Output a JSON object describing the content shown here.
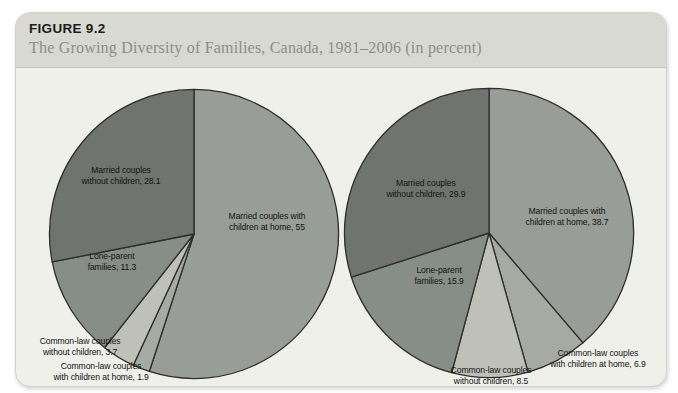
{
  "header": {
    "figure_label": "FIGURE 9.2",
    "title": "The Growing Diversity of Families, Canada, 1981–2006 (in percent)"
  },
  "colors": {
    "panel_header_bg": "#d8d9d2",
    "panel_body_bg": "#f0f0ea",
    "slice_stroke": "#2e2f2c",
    "married_with_children": "#989d98",
    "common_law_with_children": "#a6aaa3",
    "common_law_without_children": "#bfc1b9",
    "lone_parent": "#878d87",
    "married_without_children": "#6f746f"
  },
  "chart_data": [
    {
      "type": "pie",
      "name": "families-1981",
      "start_angle_deg": -90,
      "direction": "clockwise",
      "labels": [
        "Married couples with children at home",
        "Common-law couples with children at home",
        "Common-law couples without children",
        "Lone-parent families",
        "Married couples without children"
      ],
      "values": [
        55,
        1.9,
        3.7,
        11.3,
        28.1
      ],
      "slices": [
        {
          "id": "married-with-children",
          "value": 55,
          "color": "#989d98",
          "label_text": "Married couples with\nchildren at home, 55"
        },
        {
          "id": "common-law-with-children",
          "value": 1.9,
          "color": "#a6aaa3",
          "label_text": "Common-law couples\nwith children at home, 1.9"
        },
        {
          "id": "common-law-without-children",
          "value": 3.7,
          "color": "#bfc1b9",
          "label_text": "Common-law couples\nwithout children, 3.7"
        },
        {
          "id": "lone-parent-families",
          "value": 11.3,
          "color": "#878d87",
          "label_text": "Lone-parent\nfamilies, 11.3"
        },
        {
          "id": "married-without-children",
          "value": 28.1,
          "color": "#6f746f",
          "label_text": "Married couples\nwithout children, 28.1"
        }
      ]
    },
    {
      "type": "pie",
      "name": "families-2006",
      "start_angle_deg": -90,
      "direction": "clockwise",
      "labels": [
        "Married couples with children at home",
        "Common-law couples with children at home",
        "Common-law couples without children",
        "Lone-parent families",
        "Married couples without children"
      ],
      "values": [
        38.7,
        6.9,
        8.5,
        15.9,
        29.9
      ],
      "slices": [
        {
          "id": "married-with-children",
          "value": 38.7,
          "color": "#989d98",
          "label_text": "Married couples with\nchildren at home, 38.7"
        },
        {
          "id": "common-law-with-children",
          "value": 6.9,
          "color": "#a6aaa3",
          "label_text": "Common-law couples\nwith children at home, 6.9"
        },
        {
          "id": "common-law-without-children",
          "value": 8.5,
          "color": "#bfc1b9",
          "label_text": "Common-law couples\nwithout children, 8.5"
        },
        {
          "id": "lone-parent-families",
          "value": 15.9,
          "color": "#878d87",
          "label_text": "Lone-parent\nfamilies, 15.9"
        },
        {
          "id": "married-without-children",
          "value": 29.9,
          "color": "#6f746f",
          "label_text": "Married couples\nwithout children, 29.9"
        }
      ]
    }
  ]
}
